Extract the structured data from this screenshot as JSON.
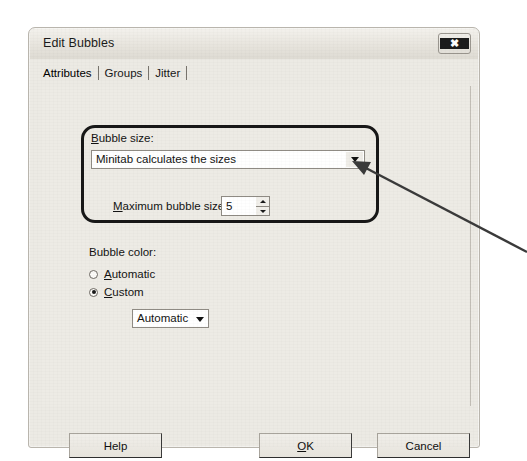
{
  "dialog": {
    "title": "Edit Bubbles",
    "close_icon": "close-icon",
    "close_glyph": "✖"
  },
  "tabs": [
    {
      "label": "Attributes",
      "active": true
    },
    {
      "label": "Groups",
      "active": false
    },
    {
      "label": "Jitter",
      "active": false
    }
  ],
  "bubble_size": {
    "label": "Bubble size:",
    "label_accel": "B",
    "combo_value": "Minitab calculates the sizes",
    "combo_icon": "chevron-down-icon",
    "max_label": "Maximum bubble size:",
    "max_label_accel": "M",
    "max_value": "5",
    "spinner_up_icon": "spinner-up-icon",
    "spinner_down_icon": "spinner-down-icon"
  },
  "bubble_color": {
    "label": "Bubble color:",
    "options": [
      {
        "label": "Automatic",
        "accel": "A",
        "selected": false
      },
      {
        "label": "Custom",
        "accel": "C",
        "selected": true
      }
    ],
    "custom_combo_value": "Automatic",
    "custom_combo_icon": "chevron-down-icon"
  },
  "footer": {
    "help_label": "Help",
    "ok_label": "OK",
    "ok_accel": "O",
    "cancel_label": "Cancel"
  },
  "annotation": {
    "highlight_target": "bubble-size-group",
    "arrow_color": "#3a3a3a",
    "arrow_from_x": 527,
    "arrow_from_y": 252,
    "arrow_to_x": 354,
    "arrow_to_y": 162
  }
}
